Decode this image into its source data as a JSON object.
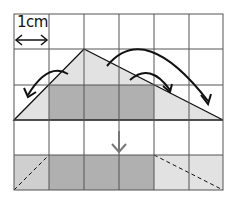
{
  "diagram": {
    "scale_label": "1cm",
    "grid": {
      "cols": 6,
      "rows": 5,
      "cell_size_cm": 1
    },
    "colors": {
      "grid_line": "#555555",
      "triangle_light": "#e2e2e2",
      "triangle_dark": "#b0b0b0",
      "arrow": "#111111",
      "down_arrow": "#777777"
    }
  }
}
